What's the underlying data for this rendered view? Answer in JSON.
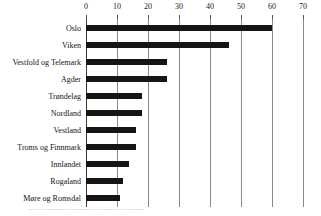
{
  "chart_data": {
    "type": "bar",
    "orientation": "horizontal",
    "title": "",
    "subtitle": "",
    "xlabel": "",
    "ylabel": "",
    "categories": [
      "Oslo",
      "Viken",
      "Vestfold og Telemark",
      "Agder",
      "Trøndelag",
      "Nordland",
      "Vestland",
      "Troms og Finnmark",
      "Innlandet",
      "Rogaland",
      "Møre og Romsdal"
    ],
    "values": [
      60,
      46,
      26,
      26,
      18,
      18,
      16,
      16,
      14,
      12,
      11
    ],
    "xlim": [
      0,
      70
    ],
    "xticks": [
      0,
      10,
      20,
      30,
      40,
      50,
      60,
      70
    ],
    "xticklabels": [
      "0",
      "10",
      "20",
      "30",
      "40",
      "50",
      "60",
      "70"
    ],
    "grid": true,
    "grid_axis": "x",
    "legend": false,
    "bar_color": "#151515",
    "grid_color": "#8b8b8b",
    "axis_color": "#3a3a3a",
    "background_color": "#ffffff"
  },
  "caption": {
    "text": "…………………………………………"
  }
}
